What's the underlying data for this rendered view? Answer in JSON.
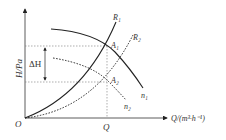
{
  "diagram": {
    "type": "pump-characteristic",
    "y_axis_label": "H/Pa",
    "x_axis_label": "Q/(m³·h⁻¹)",
    "origin_label": "O",
    "q_tick_label": "Q",
    "delta_label": "ΔH",
    "curves": [
      {
        "id": "R1",
        "label": "R₁",
        "style": "solid",
        "kind": "system-resistance"
      },
      {
        "id": "R2",
        "label": "R₂",
        "style": "dotted",
        "kind": "system-resistance"
      },
      {
        "id": "n1",
        "label": "n₁",
        "style": "solid",
        "kind": "pump-speed"
      },
      {
        "id": "n2",
        "label": "n₂",
        "style": "dotted",
        "kind": "pump-speed"
      }
    ],
    "points": [
      {
        "id": "A1",
        "label": "A₁"
      },
      {
        "id": "A2",
        "label": "A₂"
      }
    ],
    "colors": {
      "line": "#222222",
      "guide": "#777777"
    }
  }
}
